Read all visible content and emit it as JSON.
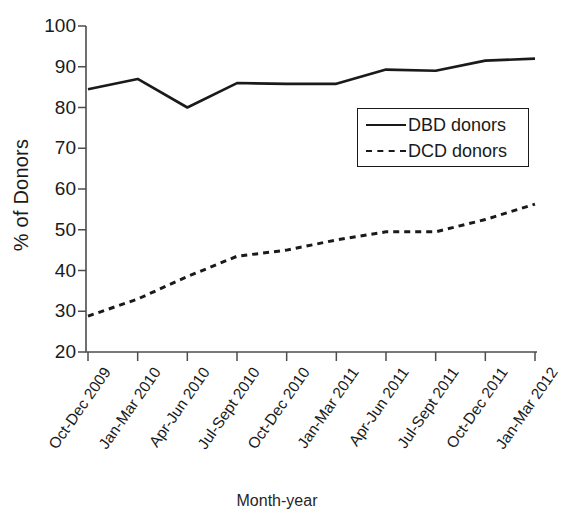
{
  "chart_data": {
    "type": "line",
    "title": "",
    "subtitle": "",
    "xlabel": "Month-year",
    "ylabel": "% of Donors",
    "ylim": [
      20,
      100
    ],
    "yticks": [
      20,
      30,
      40,
      50,
      60,
      70,
      80,
      90,
      100
    ],
    "grid": false,
    "legend_position": "upper right",
    "categories": [
      "Oct-Dec 2009",
      "Jan-Mar 2010",
      "Apr-Jun 2010",
      "Jul-Sept 2010",
      "Oct-Dec 2010",
      "Jan-Mar 2011",
      "Apr-Jun 2011",
      "Jul-Sept 2011",
      "Oct-Dec 2011",
      "Jan-Mar 2012"
    ],
    "series": [
      {
        "name": "DBD donors",
        "style": "solid",
        "color": "#1a1a1a",
        "values": [
          84.5,
          87.0,
          80.0,
          86.0,
          85.8,
          85.8,
          89.3,
          89.0,
          91.5,
          92.0
        ]
      },
      {
        "name": "DCD donors",
        "style": "dashed",
        "color": "#1a1a1a",
        "values": [
          28.8,
          33.0,
          38.5,
          43.5,
          45.0,
          47.5,
          49.5,
          49.5,
          52.5,
          56.3
        ]
      }
    ]
  },
  "axes": {
    "y_tick_labels": [
      "100",
      "90",
      "80",
      "70",
      "60",
      "50",
      "40",
      "30",
      "20"
    ],
    "x_tick_labels": [
      "Oct-Dec 2009",
      "Jan-Mar 2010",
      "Apr-Jun 2010",
      "Jul-Sept 2010",
      "Oct-Dec 2010",
      "Jan-Mar 2011",
      "Apr-Jun 2011",
      "Jul-Sept 2011",
      "Oct-Dec 2011",
      "Jan-Mar 2012"
    ],
    "ylabel": "% of Donors",
    "xlabel": "Month-year"
  },
  "legend": {
    "entries": [
      {
        "label": "DBD donors",
        "style": "solid"
      },
      {
        "label": "DCD donors",
        "style": "dashed"
      }
    ]
  }
}
